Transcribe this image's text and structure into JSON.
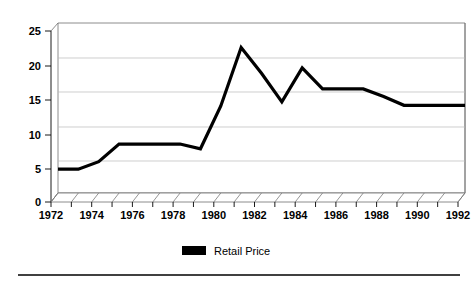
{
  "chart_data": {
    "type": "line",
    "title": "",
    "subtitle": "",
    "xlabel": "",
    "ylabel": "",
    "xlim": [
      1972,
      1992
    ],
    "ylim": [
      0,
      25
    ],
    "yticks": [
      0,
      5,
      10,
      15,
      20,
      25
    ],
    "ytick_labels": [
      "0",
      "5",
      "10",
      "15",
      "20",
      "25"
    ],
    "xticks": [
      1972,
      1973,
      1974,
      1975,
      1976,
      1977,
      1978,
      1979,
      1980,
      1981,
      1982,
      1983,
      1984,
      1985,
      1986,
      1987,
      1988,
      1989,
      1990,
      1991,
      1992
    ],
    "xtick_labels": [
      "1972",
      "",
      "1974",
      "",
      "1976",
      "",
      "1978",
      "",
      "1980",
      "",
      "1982",
      "",
      "1984",
      "",
      "1986",
      "",
      "1988",
      "",
      "1990",
      "",
      "1992"
    ],
    "x_labeled_ticks": [
      "1972",
      "1974",
      "1976",
      "1978",
      "1980",
      "1982",
      "1984",
      "1986",
      "1988",
      "1990",
      "1992"
    ],
    "grid": true,
    "grid_axis": "y",
    "legend_position": "bottom",
    "style": "3d-floor-hatched",
    "series": [
      {
        "name": "Retail Price",
        "color": "#000000",
        "x": [
          1972,
          1973,
          1974,
          1975,
          1976,
          1977,
          1978,
          1979,
          1980,
          1981,
          1982,
          1983,
          1984,
          1985,
          1986,
          1987,
          1988,
          1989,
          1990,
          1991,
          1992
        ],
        "values": [
          3.5,
          3.5,
          4.6,
          7.2,
          7.2,
          7.2,
          7.2,
          6.5,
          12.8,
          21.4,
          17.6,
          13.4,
          18.4,
          15.3,
          15.3,
          15.3,
          14.2,
          12.9,
          12.9,
          12.9,
          12.9
        ]
      }
    ]
  },
  "legend": {
    "entries": [
      {
        "label": "Retail Price",
        "color": "#000000"
      }
    ]
  },
  "axes": {
    "y_tick_labels": [
      "25",
      "20",
      "15",
      "10",
      "5",
      "0"
    ],
    "x_tick_labels": [
      "1972",
      "1974",
      "1976",
      "1978",
      "1980",
      "1982",
      "1984",
      "1986",
      "1988",
      "1990",
      "1992"
    ]
  },
  "colors": {
    "series": "#000000",
    "grid": "#b9b9b9",
    "axis": "#000000",
    "background": "#ffffff"
  }
}
